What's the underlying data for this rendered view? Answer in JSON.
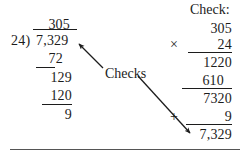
{
  "problem": {
    "type": "long-division-with-check",
    "dividend": "7,329",
    "divisor": "24",
    "quotient": "305",
    "remainder": "9",
    "connector_label": "Checks",
    "check_heading": "Check:"
  },
  "division": {
    "quotient": "305",
    "divisor": "24",
    "divisor_paren": "24)",
    "dividend": "7,329",
    "steps": [
      {
        "value": "72"
      },
      {
        "value": "129"
      },
      {
        "value": "120"
      },
      {
        "value": "9"
      }
    ]
  },
  "check": {
    "heading": "Check:",
    "multiplicand": "305",
    "times_sign": "×",
    "multiplier": "24",
    "partial_products": [
      {
        "value": "1220"
      },
      {
        "value": "610"
      }
    ],
    "product": "7320",
    "plus_sign": "+",
    "remainder": "9",
    "total": "7,329"
  },
  "colors": {
    "ink": "#1c1c1c",
    "rule": "#1c1c1c",
    "page_rule": "#555555",
    "background": "#ffffff"
  }
}
